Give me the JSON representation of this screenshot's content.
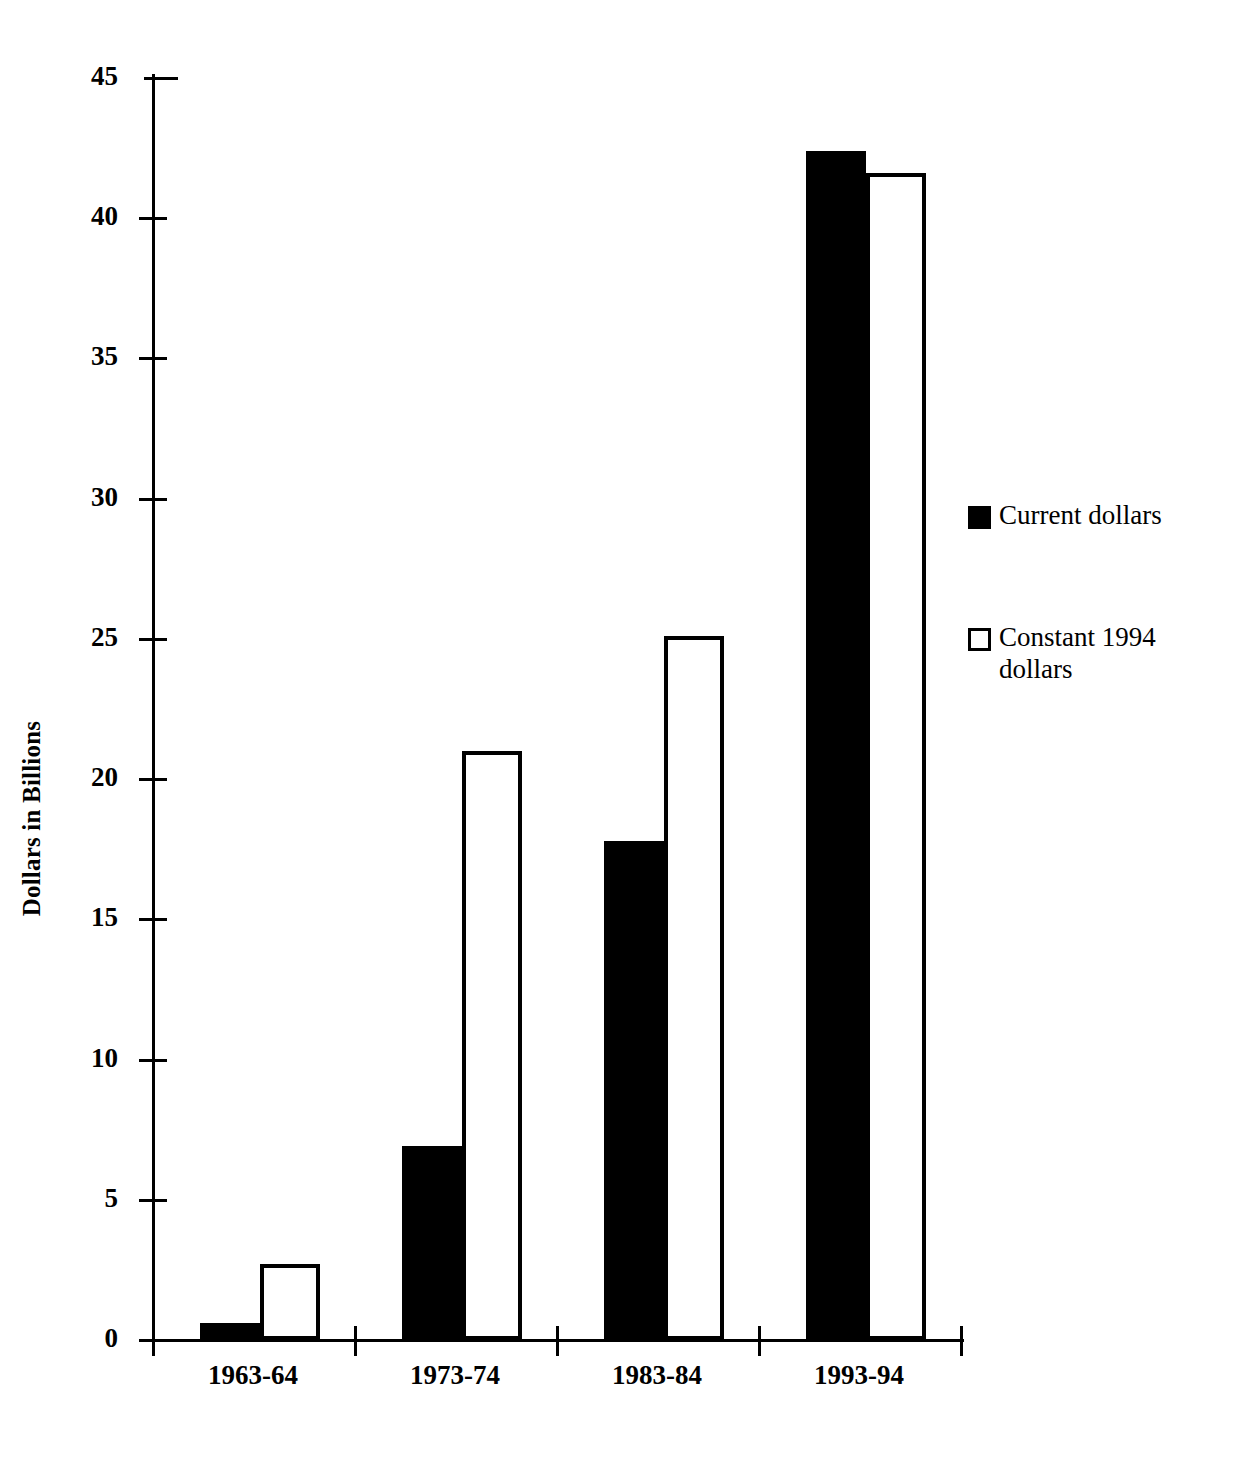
{
  "chart_data": {
    "type": "bar",
    "title": "",
    "subtitle": "",
    "xlabel": "",
    "ylabel": "Dollars in Billions",
    "categories": [
      "1963-64",
      "1973-74",
      "1983-84",
      "1993-94"
    ],
    "series": [
      {
        "name": "Current dollars",
        "values": [
          0.6,
          6.9,
          17.8,
          42.4
        ],
        "style": "filled",
        "color": "#000000"
      },
      {
        "name": "Constant 1994 dollars",
        "values": [
          2.7,
          21.0,
          25.1,
          41.6
        ],
        "style": "hollow",
        "color": "#FFFFFF"
      }
    ],
    "ylim": [
      0,
      45
    ],
    "ytick_labels": [
      "45",
      "40",
      "35",
      "30",
      "25",
      "20",
      "15",
      "10",
      "5",
      "0"
    ],
    "ytick_values": [
      45,
      40,
      35,
      30,
      25,
      20,
      15,
      10,
      5,
      0
    ],
    "grid": false,
    "legend_position": "right",
    "legend_entries": [
      {
        "label": "Current dollars",
        "swatch": "filled-square"
      },
      {
        "label": "Constant 1994 dollars",
        "swatch": "hollow-square"
      }
    ]
  },
  "axes": {
    "y_title": "Dollars in Billions"
  }
}
